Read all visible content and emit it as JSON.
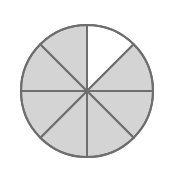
{
  "diagram": {
    "type": "fraction-circle",
    "total_sectors": 8,
    "shaded_sectors": 7,
    "unshaded_sectors": 1,
    "unshaded_sector_index": 0,
    "fraction_shaded": "7/8",
    "colors": {
      "shaded": "#d4d4d4",
      "unshaded": "#ffffff",
      "outline": "#6e6e6e",
      "background": "#ffffff"
    }
  }
}
